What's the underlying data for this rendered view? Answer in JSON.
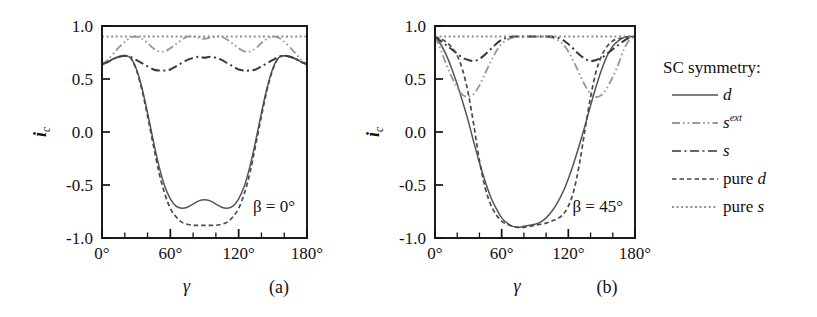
{
  "figure": {
    "caption_panels": [
      "(a)",
      "(b)"
    ],
    "background": "#ffffff"
  },
  "legend": {
    "title": "SC symmetry:",
    "entries": [
      {
        "label": "d",
        "style": "solid",
        "color": "#555555",
        "dash": "none"
      },
      {
        "label": "s",
        "sup": "ext",
        "style": "dash-dot-dot",
        "color": "#9a9a9a",
        "dash": "9,3,1.5,3,1.5,3"
      },
      {
        "label": "s",
        "style": "dash-dot",
        "color": "#666666",
        "dash": "9,3.5,2,3.5"
      },
      {
        "label": "pure d",
        "style": "dashed",
        "color": "#4a4a4a",
        "dash": "4.5,3"
      },
      {
        "label": "pure s",
        "style": "dotted",
        "color": "#8a8a8a",
        "dash": "2,2.6"
      }
    ]
  },
  "axes": {
    "x": {
      "label": "γ",
      "ticks": [
        "0°",
        "60°",
        "120°",
        "180°"
      ],
      "tick_values": [
        0,
        60,
        120,
        180
      ],
      "minor_step": 20,
      "range": [
        0,
        180
      ]
    },
    "y": {
      "label_base": "i",
      "label_sub": "c",
      "ticks": [
        "1.0",
        "0.5",
        "0.0",
        "-0.5",
        "-1.0"
      ],
      "tick_values": [
        1.0,
        0.5,
        0.0,
        -0.5,
        -1.0
      ],
      "range": [
        -1.0,
        1.0
      ]
    }
  },
  "chart_data": {
    "type": "line",
    "title": "",
    "xlabel": "γ",
    "ylabel": "i_c",
    "xlim": [
      0,
      180
    ],
    "ylim": [
      -1.0,
      1.0
    ],
    "grid": false,
    "legend_position": "right-outside",
    "panels": [
      {
        "id": "a",
        "label": "(a)",
        "annotation": "β = 0°",
        "x": [
          0,
          5,
          10,
          15,
          20,
          25,
          30,
          35,
          40,
          45,
          50,
          55,
          60,
          65,
          70,
          75,
          80,
          85,
          90,
          95,
          100,
          105,
          110,
          115,
          120,
          125,
          130,
          135,
          140,
          145,
          150,
          155,
          160,
          165,
          170,
          175,
          180
        ],
        "series": [
          {
            "name": "d",
            "style": "solid",
            "color": "#555555",
            "values": [
              0.64,
              0.66,
              0.69,
              0.71,
              0.72,
              0.7,
              0.6,
              0.42,
              0.18,
              -0.08,
              -0.32,
              -0.51,
              -0.63,
              -0.7,
              -0.72,
              -0.71,
              -0.68,
              -0.65,
              -0.64,
              -0.65,
              -0.68,
              -0.71,
              -0.72,
              -0.7,
              -0.63,
              -0.51,
              -0.32,
              -0.08,
              0.18,
              0.42,
              0.6,
              0.7,
              0.72,
              0.71,
              0.69,
              0.66,
              0.64
            ]
          },
          {
            "name": "s^ext",
            "style": "dash-dot-dot",
            "color": "#9a9a9a",
            "values": [
              0.63,
              0.68,
              0.74,
              0.8,
              0.85,
              0.89,
              0.9,
              0.88,
              0.84,
              0.79,
              0.76,
              0.76,
              0.79,
              0.83,
              0.87,
              0.9,
              0.9,
              0.89,
              0.88,
              0.89,
              0.9,
              0.9,
              0.87,
              0.83,
              0.79,
              0.76,
              0.76,
              0.79,
              0.84,
              0.88,
              0.9,
              0.89,
              0.85,
              0.8,
              0.74,
              0.68,
              0.63
            ]
          },
          {
            "name": "s",
            "style": "dash-dot",
            "color": "#3a3a3a",
            "values": [
              0.64,
              0.66,
              0.69,
              0.71,
              0.72,
              0.71,
              0.68,
              0.65,
              0.62,
              0.59,
              0.58,
              0.58,
              0.59,
              0.62,
              0.65,
              0.68,
              0.7,
              0.71,
              0.7,
              0.71,
              0.7,
              0.68,
              0.65,
              0.62,
              0.59,
              0.58,
              0.58,
              0.59,
              0.62,
              0.65,
              0.68,
              0.71,
              0.72,
              0.71,
              0.69,
              0.66,
              0.64
            ]
          },
          {
            "name": "pure d",
            "style": "dashed",
            "color": "#4a4a4a",
            "values": [
              0.64,
              0.66,
              0.69,
              0.71,
              0.72,
              0.7,
              0.59,
              0.4,
              0.15,
              -0.12,
              -0.38,
              -0.58,
              -0.72,
              -0.8,
              -0.85,
              -0.87,
              -0.88,
              -0.88,
              -0.88,
              -0.88,
              -0.88,
              -0.87,
              -0.85,
              -0.8,
              -0.72,
              -0.58,
              -0.38,
              -0.12,
              0.15,
              0.4,
              0.59,
              0.7,
              0.72,
              0.71,
              0.69,
              0.66,
              0.64
            ]
          },
          {
            "name": "pure s",
            "style": "dotted",
            "color": "#8a8a8a",
            "values": [
              0.9,
              0.9,
              0.9,
              0.9,
              0.9,
              0.9,
              0.9,
              0.9,
              0.9,
              0.9,
              0.9,
              0.9,
              0.9,
              0.9,
              0.9,
              0.9,
              0.9,
              0.9,
              0.9,
              0.9,
              0.9,
              0.9,
              0.9,
              0.9,
              0.9,
              0.9,
              0.9,
              0.9,
              0.9,
              0.9,
              0.9,
              0.9,
              0.9,
              0.9,
              0.9,
              0.9,
              0.9
            ]
          }
        ]
      },
      {
        "id": "b",
        "label": "(b)",
        "annotation": "β = 45°",
        "x": [
          0,
          5,
          10,
          15,
          20,
          25,
          30,
          35,
          40,
          45,
          50,
          55,
          60,
          65,
          70,
          75,
          80,
          85,
          90,
          95,
          100,
          105,
          110,
          115,
          120,
          125,
          130,
          135,
          140,
          145,
          150,
          155,
          160,
          165,
          170,
          175,
          180
        ],
        "series": [
          {
            "name": "d",
            "style": "solid",
            "color": "#555555",
            "values": [
              0.9,
              0.83,
              0.73,
              0.6,
              0.45,
              0.28,
              0.1,
              -0.1,
              -0.29,
              -0.46,
              -0.61,
              -0.72,
              -0.81,
              -0.86,
              -0.89,
              -0.9,
              -0.89,
              -0.88,
              -0.87,
              -0.85,
              -0.81,
              -0.75,
              -0.67,
              -0.57,
              -0.44,
              -0.29,
              -0.12,
              0.06,
              0.25,
              0.43,
              0.59,
              0.72,
              0.81,
              0.86,
              0.89,
              0.9,
              0.9
            ]
          },
          {
            "name": "s^ext",
            "style": "dash-dot-dot",
            "color": "#9a9a9a",
            "values": [
              0.9,
              0.78,
              0.64,
              0.52,
              0.42,
              0.35,
              0.33,
              0.36,
              0.44,
              0.55,
              0.66,
              0.76,
              0.83,
              0.87,
              0.89,
              0.9,
              0.9,
              0.9,
              0.9,
              0.9,
              0.9,
              0.89,
              0.87,
              0.83,
              0.76,
              0.66,
              0.55,
              0.44,
              0.36,
              0.33,
              0.35,
              0.42,
              0.52,
              0.64,
              0.78,
              0.87,
              0.9
            ]
          },
          {
            "name": "s",
            "style": "dash-dot",
            "color": "#3a3a3a",
            "values": [
              0.9,
              0.86,
              0.82,
              0.78,
              0.74,
              0.7,
              0.68,
              0.67,
              0.69,
              0.73,
              0.78,
              0.83,
              0.87,
              0.89,
              0.9,
              0.9,
              0.9,
              0.9,
              0.9,
              0.9,
              0.9,
              0.9,
              0.89,
              0.87,
              0.83,
              0.78,
              0.73,
              0.69,
              0.67,
              0.68,
              0.7,
              0.74,
              0.78,
              0.82,
              0.86,
              0.89,
              0.9
            ]
          },
          {
            "name": "pure d",
            "style": "dashed",
            "color": "#4a4a4a",
            "values": [
              0.9,
              0.88,
              0.85,
              0.8,
              0.72,
              0.58,
              0.36,
              0.06,
              -0.27,
              -0.52,
              -0.68,
              -0.78,
              -0.84,
              -0.87,
              -0.89,
              -0.9,
              -0.9,
              -0.89,
              -0.88,
              -0.87,
              -0.86,
              -0.84,
              -0.82,
              -0.78,
              -0.7,
              -0.55,
              -0.3,
              0.02,
              0.33,
              0.57,
              0.72,
              0.81,
              0.86,
              0.88,
              0.89,
              0.9,
              0.9
            ]
          },
          {
            "name": "pure s",
            "style": "dotted",
            "color": "#8a8a8a",
            "values": [
              0.9,
              0.9,
              0.9,
              0.9,
              0.9,
              0.9,
              0.9,
              0.9,
              0.9,
              0.9,
              0.9,
              0.9,
              0.9,
              0.9,
              0.9,
              0.9,
              0.9,
              0.9,
              0.9,
              0.9,
              0.9,
              0.9,
              0.9,
              0.9,
              0.9,
              0.9,
              0.9,
              0.9,
              0.9,
              0.9,
              0.9,
              0.9,
              0.9,
              0.9,
              0.9,
              0.9,
              0.9
            ]
          }
        ]
      }
    ]
  }
}
